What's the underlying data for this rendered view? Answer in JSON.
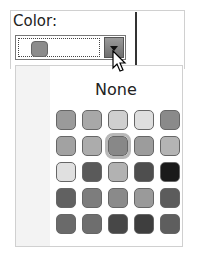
{
  "label": "Color:",
  "combo": {
    "selected_color": "#8c8c8c"
  },
  "dropdown": {
    "none_label": "None",
    "selected_index": 7,
    "swatches": [
      "#9a9a9a",
      "#a8a8a8",
      "#cfcfcf",
      "#dedede",
      "#8a8a8a",
      "#a2a2a2",
      "#acacac",
      "#888888",
      "#9c9c9c",
      "#b4b4b4",
      "#e0e0e0",
      "#5a5a5a",
      "#b2b2b2",
      "#4e4e4e",
      "#1a1a1a",
      "#616161",
      "#7d7d7d",
      "#8a8a8a",
      "#9a9a9a",
      "#5c5c5c",
      "#6a6a6a",
      "#6e6e6e",
      "#474747",
      "#3e3e3e",
      "#5e5e5e"
    ]
  }
}
